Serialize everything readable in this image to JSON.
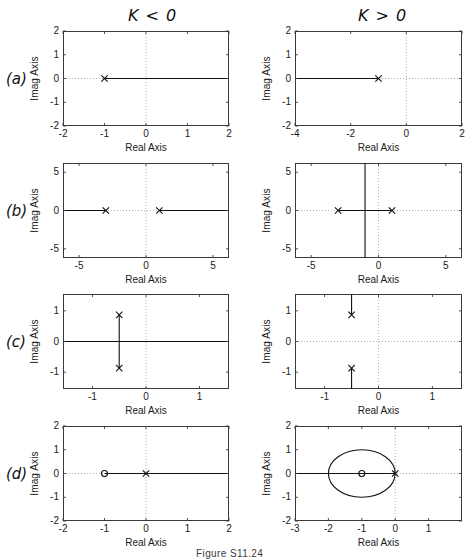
{
  "figure": {
    "caption": "Figure S11.24",
    "column_headers": [
      {
        "id": "col-k-negative",
        "label": "K < 0"
      },
      {
        "id": "col-k-positive",
        "label": "K > 0"
      }
    ],
    "row_labels": [
      {
        "id": "row-a",
        "label": "(a)"
      },
      {
        "id": "row-b",
        "label": "(b)"
      },
      {
        "id": "row-c",
        "label": "(c)"
      },
      {
        "id": "row-d",
        "label": "(d)"
      }
    ],
    "axis_labels": {
      "x": "Real Axis",
      "y": "Imag Axis"
    }
  },
  "chart_data": [
    {
      "id": "panel-a-left",
      "type": "scatter",
      "title": "",
      "row": "(a)",
      "column": "K < 0",
      "xlabel": "Real Axis",
      "ylabel": "Imag Axis",
      "xlim": [
        -2,
        2
      ],
      "ylim": [
        -2,
        2
      ],
      "xticks": [
        -2,
        -1,
        0,
        1,
        2
      ],
      "yticks": [
        -2,
        -1,
        0,
        1,
        2
      ],
      "grid": "dotted-zero-lines",
      "poles": [
        {
          "x": -1,
          "y": 0
        }
      ],
      "zeros": [],
      "locus_segments": [
        {
          "from": [
            -1,
            0
          ],
          "to": [
            2,
            0
          ]
        }
      ],
      "circles": []
    },
    {
      "id": "panel-a-right",
      "type": "scatter",
      "title": "",
      "row": "(a)",
      "column": "K > 0",
      "xlabel": "Real Axis",
      "ylabel": "Imag Axis",
      "xlim": [
        -4,
        2
      ],
      "ylim": [
        -2,
        2
      ],
      "xticks": [
        -4,
        -2,
        0,
        2
      ],
      "yticks": [
        -2,
        -1,
        0,
        1,
        2
      ],
      "grid": "dotted-zero-lines",
      "poles": [
        {
          "x": -1,
          "y": 0
        }
      ],
      "zeros": [],
      "locus_segments": [
        {
          "from": [
            -1,
            0
          ],
          "to": [
            -4,
            0
          ]
        }
      ],
      "circles": []
    },
    {
      "id": "panel-b-left",
      "type": "scatter",
      "title": "",
      "row": "(b)",
      "column": "K < 0",
      "xlabel": "Real Axis",
      "ylabel": "Imag Axis",
      "xlim": [
        -6.2,
        6.2
      ],
      "ylim": [
        -6.2,
        6.2
      ],
      "xticks": [
        -5,
        0,
        5
      ],
      "yticks": [
        -5,
        0,
        5
      ],
      "grid": "dotted-zero-lines",
      "poles": [
        {
          "x": -3,
          "y": 0
        },
        {
          "x": 1,
          "y": 0
        }
      ],
      "zeros": [],
      "locus_segments": [
        {
          "from": [
            -3,
            0
          ],
          "to": [
            -6.2,
            0
          ]
        },
        {
          "from": [
            1,
            0
          ],
          "to": [
            6.2,
            0
          ]
        }
      ],
      "circles": []
    },
    {
      "id": "panel-b-right",
      "type": "scatter",
      "title": "",
      "row": "(b)",
      "column": "K > 0",
      "xlabel": "Real Axis",
      "ylabel": "Imag Axis",
      "xlim": [
        -6.2,
        6.2
      ],
      "ylim": [
        -6.2,
        6.2
      ],
      "xticks": [
        -5,
        0,
        5
      ],
      "yticks": [
        -5,
        0,
        5
      ],
      "grid": "dotted-zero-lines",
      "poles": [
        {
          "x": -3,
          "y": 0
        },
        {
          "x": 1,
          "y": 0
        }
      ],
      "zeros": [],
      "locus_segments": [
        {
          "from": [
            -3,
            0
          ],
          "to": [
            1,
            0
          ]
        },
        {
          "from": [
            -1,
            -6.2
          ],
          "to": [
            -1,
            6.2
          ]
        }
      ],
      "circles": []
    },
    {
      "id": "panel-c-left",
      "type": "scatter",
      "title": "",
      "row": "(c)",
      "column": "K < 0",
      "xlabel": "Real Axis",
      "ylabel": "Imag Axis",
      "xlim": [
        -1.55,
        1.55
      ],
      "ylim": [
        -1.55,
        1.55
      ],
      "xticks": [
        -1,
        0,
        1
      ],
      "yticks": [
        -1,
        0,
        1
      ],
      "grid": "dotted-zero-lines",
      "poles": [
        {
          "x": -0.5,
          "y": 0.87
        },
        {
          "x": -0.5,
          "y": -0.87
        }
      ],
      "zeros": [],
      "locus_segments": [
        {
          "from": [
            -0.5,
            -0.87
          ],
          "to": [
            -0.5,
            0.87
          ]
        },
        {
          "from": [
            -1.55,
            0
          ],
          "to": [
            1.55,
            0
          ]
        }
      ],
      "circles": []
    },
    {
      "id": "panel-c-right",
      "type": "scatter",
      "title": "",
      "row": "(c)",
      "column": "K > 0",
      "xlabel": "Real Axis",
      "ylabel": "Imag Axis",
      "xlim": [
        -1.55,
        1.55
      ],
      "ylim": [
        -1.55,
        1.55
      ],
      "xticks": [
        -1,
        0,
        1
      ],
      "yticks": [
        -1,
        0,
        1
      ],
      "grid": "dotted-zero-lines",
      "poles": [
        {
          "x": -0.5,
          "y": 0.87
        },
        {
          "x": -0.5,
          "y": -0.87
        }
      ],
      "zeros": [],
      "locus_segments": [
        {
          "from": [
            -0.5,
            0.87
          ],
          "to": [
            -0.5,
            1.55
          ]
        },
        {
          "from": [
            -0.5,
            -0.87
          ],
          "to": [
            -0.5,
            -1.55
          ]
        }
      ],
      "circles": []
    },
    {
      "id": "panel-d-left",
      "type": "scatter",
      "title": "",
      "row": "(d)",
      "column": "K < 0",
      "xlabel": "Real Axis",
      "ylabel": "Imag Axis",
      "xlim": [
        -2,
        2
      ],
      "ylim": [
        -2,
        2
      ],
      "xticks": [
        -2,
        -1,
        0,
        1,
        2
      ],
      "yticks": [
        -2,
        -1,
        0,
        1,
        2
      ],
      "grid": "dotted-zero-lines",
      "poles": [
        {
          "x": 0,
          "y": 0
        }
      ],
      "zeros": [
        {
          "x": -1,
          "y": 0
        }
      ],
      "locus_segments": [
        {
          "from": [
            -1,
            0
          ],
          "to": [
            2,
            0
          ]
        }
      ],
      "circles": []
    },
    {
      "id": "panel-d-right",
      "type": "scatter",
      "title": "",
      "row": "(d)",
      "column": "K > 0",
      "xlabel": "Real Axis",
      "ylabel": "Imag Axis",
      "xlim": [
        -3,
        2
      ],
      "ylim": [
        -2,
        2
      ],
      "xticks": [
        -3,
        -2,
        -1,
        0,
        1
      ],
      "yticks": [
        -2,
        -1,
        0,
        1,
        2
      ],
      "grid": "dotted-zero-lines",
      "poles": [
        {
          "x": 0,
          "y": 0
        }
      ],
      "zeros": [
        {
          "x": -1,
          "y": 0
        }
      ],
      "locus_segments": [
        {
          "from": [
            -3,
            0
          ],
          "to": [
            0,
            0
          ]
        }
      ],
      "circles": [
        {
          "cx": -1,
          "cy": 0,
          "r": 1
        }
      ]
    }
  ],
  "layout": {
    "panels": [
      {
        "id": "panel-a-left",
        "box": [
          63,
          31,
          166,
          95
        ]
      },
      {
        "id": "panel-a-right",
        "box": [
          295,
          31,
          167,
          95
        ]
      },
      {
        "id": "panel-b-left",
        "box": [
          63,
          163,
          166,
          95
        ]
      },
      {
        "id": "panel-b-right",
        "box": [
          295,
          163,
          167,
          95
        ]
      },
      {
        "id": "panel-c-left",
        "box": [
          63,
          294,
          166,
          95
        ]
      },
      {
        "id": "panel-c-right",
        "box": [
          295,
          294,
          167,
          95
        ]
      },
      {
        "id": "panel-d-left",
        "box": [
          63,
          426,
          166,
          95
        ]
      },
      {
        "id": "panel-d-right",
        "box": [
          295,
          426,
          167,
          95
        ]
      }
    ],
    "headers": [
      {
        "id": "col-k-negative",
        "pos": [
          128,
          6
        ]
      },
      {
        "id": "col-k-positive",
        "pos": [
          358,
          6
        ]
      }
    ],
    "row_label_pos": [
      {
        "id": "row-a",
        "pos": [
          6,
          70
        ]
      },
      {
        "id": "row-b",
        "pos": [
          6,
          202
        ]
      },
      {
        "id": "row-c",
        "pos": [
          6,
          333
        ]
      },
      {
        "id": "row-d",
        "pos": [
          6,
          465
        ]
      }
    ],
    "caption_pos": [
      196,
      548
    ]
  }
}
